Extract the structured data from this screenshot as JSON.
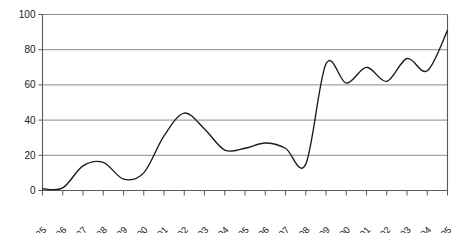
{
  "chart_data": {
    "type": "line",
    "title": "",
    "subtitle": "",
    "xlabel": "",
    "ylabel": "",
    "xlim": [
      1985,
      2005
    ],
    "ylim": [
      0,
      100
    ],
    "grid": true,
    "legend": false,
    "legend_position": "none",
    "line_color": "#1a1a1a",
    "grid_color": "#8c8c8c",
    "axis_color": "#595959",
    "background": "#ffffff",
    "y_ticks": [
      0,
      20,
      40,
      60,
      80,
      100
    ],
    "y_tick_labels": [
      "0",
      "20",
      "40",
      "60",
      "80",
      "100"
    ],
    "categories": [
      "1985",
      "1986",
      "1987",
      "1988",
      "1989",
      "1990",
      "1991",
      "1992",
      "1993",
      "1994",
      "1995",
      "1996",
      "1997",
      "1998",
      "1999",
      "2000",
      "2001",
      "2002",
      "2003",
      "2004",
      "2005"
    ],
    "x": [
      1985,
      1986,
      1987,
      1988,
      1989,
      1990,
      1991,
      1992,
      1993,
      1994,
      1995,
      1996,
      1997,
      1998,
      1999,
      2000,
      2001,
      2002,
      2003,
      2004,
      2005
    ],
    "values": [
      1,
      1.5,
      14,
      16,
      6.5,
      10,
      31,
      44,
      35,
      23,
      24,
      27,
      24,
      15,
      72,
      61,
      70,
      62,
      75,
      68,
      91
    ],
    "series": [
      {
        "name": "series-1",
        "values": [
          1,
          1.5,
          14,
          16,
          6.5,
          10,
          31,
          44,
          35,
          23,
          24,
          27,
          24,
          15,
          72,
          61,
          70,
          62,
          75,
          68,
          91
        ]
      }
    ],
    "annotations": []
  }
}
